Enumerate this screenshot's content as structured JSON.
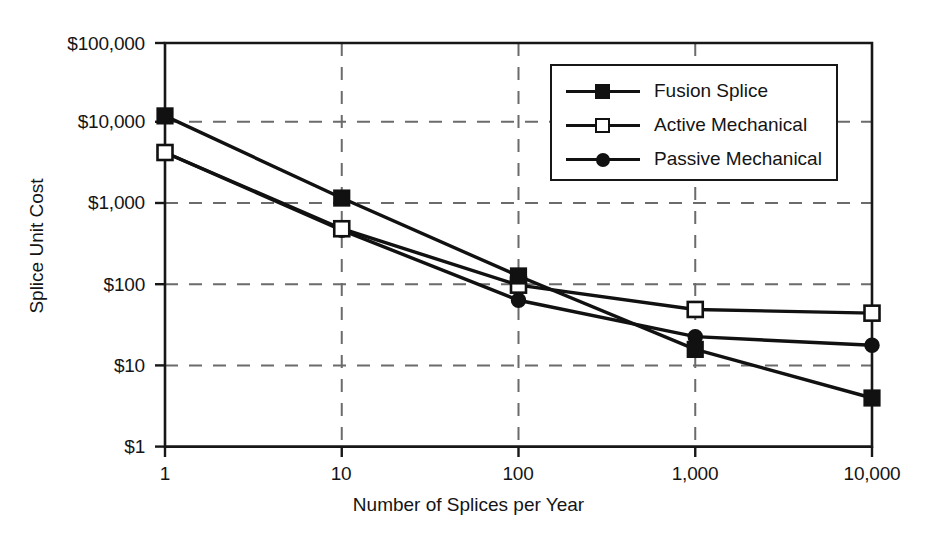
{
  "chart_data": {
    "type": "line",
    "title": "",
    "xlabel": "Number of Splices per Year",
    "ylabel": "Splice Unit Cost",
    "xscale": "log",
    "yscale": "log",
    "xlim": [
      1,
      10000
    ],
    "ylim": [
      1,
      100000
    ],
    "grid": true,
    "legend_position": "upper right",
    "x": [
      1,
      10,
      100,
      1000,
      10000
    ],
    "xticklabels": [
      "1",
      "10",
      "100",
      "1,000",
      "10,000"
    ],
    "yticks": [
      1,
      10,
      100,
      1000,
      10000,
      100000
    ],
    "yticklabels": [
      "$1",
      "$10",
      "$100",
      "$1,000",
      "$10,000",
      "$100,000"
    ],
    "series": [
      {
        "name": "Fusion Splice",
        "marker": "filled-square",
        "values": [
          12500,
          1200,
          130,
          16,
          4
        ]
      },
      {
        "name": "Active Mechanical",
        "marker": "open-square",
        "values": [
          4400,
          500,
          100,
          50,
          45
        ]
      },
      {
        "name": "Passive Mechanical",
        "marker": "filled-circle",
        "values": [
          4400,
          480,
          65,
          23,
          18
        ]
      }
    ]
  },
  "axes": {
    "y_title": "Splice Unit Cost",
    "x_title": "Number of Splices per Year",
    "y_ticks": [
      {
        "label": "$100,000",
        "value": 100000
      },
      {
        "label": "$10,000",
        "value": 10000
      },
      {
        "label": "$1,000",
        "value": 1000
      },
      {
        "label": "$100",
        "value": 100
      },
      {
        "label": "$10",
        "value": 10
      },
      {
        "label": "$1",
        "value": 1
      }
    ],
    "x_ticks": [
      {
        "label": "1",
        "value": 1
      },
      {
        "label": "10",
        "value": 10
      },
      {
        "label": "100",
        "value": 100
      },
      {
        "label": "1,000",
        "value": 1000
      },
      {
        "label": "10,000",
        "value": 10000
      }
    ]
  },
  "legend": {
    "entries": [
      {
        "label": "Fusion Splice",
        "marker": "filled-square"
      },
      {
        "label": "Active Mechanical",
        "marker": "open-square"
      },
      {
        "label": "Passive Mechanical",
        "marker": "filled-circle"
      }
    ]
  },
  "colors": {
    "line": "#111111",
    "axis": "#171717",
    "grid": "#6b6b6b",
    "background": "#ffffff"
  }
}
